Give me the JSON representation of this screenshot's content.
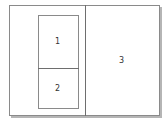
{
  "diagram": {
    "type": "layout-panes",
    "panes": [
      {
        "id": "1",
        "label": "1"
      },
      {
        "id": "2",
        "label": "2"
      },
      {
        "id": "3",
        "label": "3"
      }
    ],
    "colors": {
      "border": "#8a8a8a",
      "divider": "#6e6e6e",
      "shadow": "#b5b5b5",
      "background": "#ffffff"
    }
  }
}
